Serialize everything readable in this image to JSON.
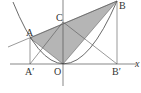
{
  "diagram": {
    "labels": {
      "A": "A",
      "B": "B",
      "C": "C",
      "O": "O",
      "A_prime": "A′",
      "B_prime": "B′",
      "x_axis": "x"
    },
    "points": {
      "O": [
        63,
        64
      ],
      "A": [
        30,
        38
      ],
      "B": [
        117,
        1
      ],
      "C": [
        63,
        22
      ],
      "A_prime": [
        30,
        64
      ],
      "B_prime": [
        117,
        64
      ]
    },
    "colors": {
      "shade": "#b5b5b5",
      "line": "#555555",
      "background": "#ffffff"
    },
    "shaded_region": "triangle A-B-O"
  }
}
